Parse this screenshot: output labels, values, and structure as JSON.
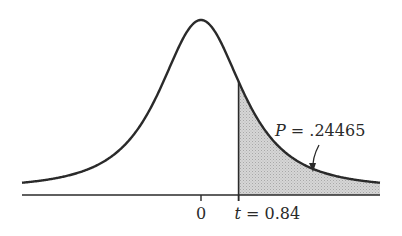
{
  "chart_data": {
    "type": "area",
    "title": "",
    "distribution": "Student t",
    "df": 2,
    "xlim": [
      -4,
      4
    ],
    "curve_color": "#2a2a2a",
    "shade_color": "#cfcfcf",
    "shaded_region": {
      "from": 0.84,
      "to": 4
    },
    "ticks": [
      {
        "value": 0,
        "label": "0"
      },
      {
        "value": 0.84,
        "label_var": "t",
        "label_rest": " = 0.84"
      }
    ],
    "annotation": {
      "var": "P",
      "text": " = .24465",
      "points_to": "shaded tail area"
    }
  }
}
